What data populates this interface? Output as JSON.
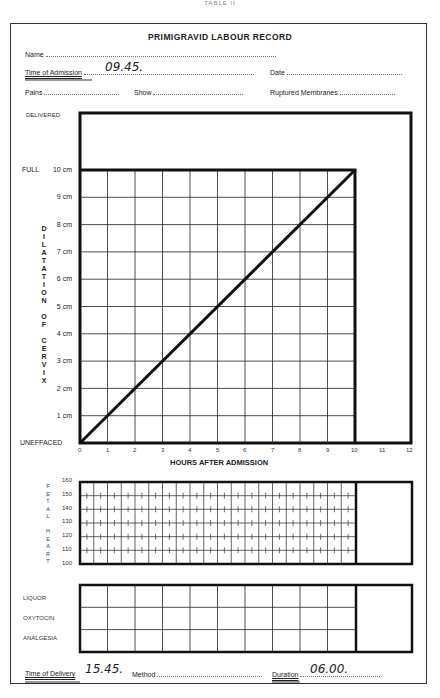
{
  "caption": "TABLE II",
  "form": {
    "title": "PRIMIGRAVID LABOUR RECORD",
    "fields": {
      "name_label": "Name",
      "time_of_admission_label": "Time of Admission",
      "time_of_admission_value": "09.45.",
      "date_label": "Date",
      "pains_label": "Pains",
      "show_label": "Show",
      "ruptured_membranes_label": "Ruptured Membranes"
    },
    "footer": {
      "time_of_delivery_label": "Time of Delivery",
      "time_of_delivery_value": "15.45.",
      "method_label": "Method",
      "duration_label": "Duration",
      "duration_value": "06.00."
    }
  },
  "partogram": {
    "delivered_label": "DELIVERED",
    "full_label": "FULL",
    "unefffaced_label": "UNEFFACED",
    "y_axis_title": "DILATATION OF CERVIX",
    "y_axis_title_letters": [
      "D",
      "I",
      "L",
      "A",
      "T",
      "A",
      "T",
      "I",
      "O",
      "N",
      "",
      "O",
      "F",
      "",
      "C",
      "E",
      "R",
      "V",
      "I",
      "X"
    ],
    "y_ticks": [
      "10 cm",
      "9 cm",
      "8 cm",
      "7 cm",
      "6 cm",
      "5 cm",
      "4 cm",
      "3 cm",
      "2 cm",
      "1 cm"
    ],
    "x_ticks": [
      "0",
      "1",
      "2",
      "3",
      "4",
      "5",
      "6",
      "7",
      "8",
      "9",
      "10",
      "11",
      "12"
    ],
    "x_axis_title": "HOURS AFTER ADMISSION"
  },
  "fetal_heart": {
    "label_letters": [
      "F",
      "E",
      "T",
      "A",
      "L",
      "",
      "H",
      "E",
      "A",
      "R",
      "T"
    ],
    "y_ticks": [
      "160",
      "150",
      "140",
      "130",
      "120",
      "110",
      "100"
    ]
  },
  "drug_rows": [
    "LIQUOR",
    "OXYTOCIN",
    "ANALGESIA"
  ],
  "chart_data": {
    "type": "line",
    "title": "PRIMIGRAVID LABOUR RECORD",
    "xlabel": "HOURS AFTER ADMISSION",
    "ylabel": "DILATATION OF CERVIX (cm)",
    "x": [
      0,
      10
    ],
    "series": [
      {
        "name": "Expected dilatation line",
        "values": [
          0,
          10
        ]
      }
    ],
    "xlim": [
      0,
      12
    ],
    "ylim": [
      0,
      10
    ],
    "grid": true
  }
}
